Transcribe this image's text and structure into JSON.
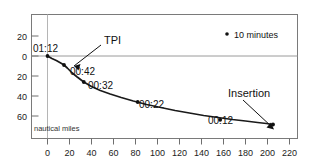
{
  "chart_data": {
    "type": "line",
    "title": "",
    "subtitle": "",
    "xlabel": "nautical miles",
    "ylabel": "",
    "xlim": [
      -12,
      228
    ],
    "ylim": [
      -72,
      30
    ],
    "grid": false,
    "legend_position": "top-right",
    "x_ticks": [
      "0",
      "20",
      "40",
      "60",
      "80",
      "100",
      "120",
      "140",
      "160",
      "180",
      "200",
      "220"
    ],
    "x_tick_values": [
      0,
      20,
      40,
      60,
      80,
      100,
      120,
      140,
      160,
      180,
      200,
      220
    ],
    "y_ticks": [
      "20",
      "0",
      "20",
      "40",
      "60"
    ],
    "y_tick_values": [
      20,
      0,
      -20,
      -40,
      -60
    ],
    "legend": [
      {
        "marker": "dot",
        "label": "10 minutes"
      }
    ],
    "series": [
      {
        "name": "descent trajectory",
        "x": [
          0,
          4,
          8,
          12,
          15,
          18,
          22,
          27,
          33,
          40,
          48,
          57,
          67,
          78,
          90,
          103,
          116,
          129,
          142,
          155,
          168,
          180,
          191,
          199,
          205
        ],
        "y": [
          0,
          -2.5,
          -4.5,
          -7,
          -9,
          -12,
          -16.5,
          -21,
          -26,
          -30.5,
          -34.5,
          -38,
          -41.5,
          -45,
          -48.5,
          -51.5,
          -54.5,
          -57,
          -59.5,
          -61.5,
          -63.5,
          -65,
          -66.5,
          -67.5,
          -68.5
        ]
      }
    ],
    "markers": [
      {
        "x": 0,
        "y": 0,
        "label": "01:12"
      },
      {
        "x": 15,
        "y": -9,
        "label": "00:42"
      },
      {
        "x": 33,
        "y": -26,
        "label": "00:32"
      },
      {
        "x": 82,
        "y": -46,
        "label": "00:22"
      },
      {
        "x": 157,
        "y": -63.8,
        "label": "00:12"
      },
      {
        "x": 205,
        "y": -68.5,
        "label": ""
      }
    ],
    "annotations": [
      {
        "name": "tpi",
        "text": "TPI",
        "target_x": 15,
        "target_y": -9
      },
      {
        "name": "insertion",
        "text": "Insertion",
        "target_x": 205,
        "target_y": -68.5
      }
    ],
    "point_labels": {
      "start": "01:12",
      "tpi_time": "00:42",
      "mid_1": "00:32",
      "mid_2": "00:22",
      "late": "00:12"
    }
  },
  "axis": {
    "x_unit_note": "nautical miles"
  }
}
